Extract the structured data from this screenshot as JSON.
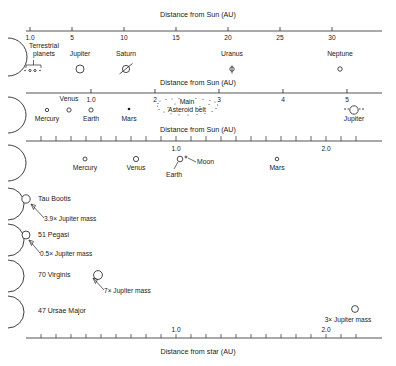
{
  "figure": {
    "bottom_axis_title": "Distance from star (AU)"
  },
  "panels": [
    {
      "id": "panel-outer-solar-system",
      "axis_title": "Distance from Sun (AU)",
      "axis_title_position": "top",
      "unit": "AU",
      "axis_range": [
        0,
        34
      ],
      "ticks": [
        {
          "value": 1.0,
          "label": "1.0"
        },
        {
          "value": 5,
          "label": "5"
        },
        {
          "value": 10,
          "label": "10"
        },
        {
          "value": 15,
          "label": "15"
        },
        {
          "value": 20,
          "label": "20"
        },
        {
          "value": 25,
          "label": "25"
        },
        {
          "value": 30,
          "label": "30"
        }
      ],
      "bodies": [
        {
          "name": "Terrestrial planets",
          "label": "Terrestrial\nplanets",
          "distance_au": 1.0,
          "marker": "bracket-with-dots",
          "count": 4
        },
        {
          "name": "Jupiter",
          "label": "Jupiter",
          "distance_au": 5.2,
          "marker": "open-circle",
          "radius": 4.0
        },
        {
          "name": "Saturn",
          "label": "Saturn",
          "distance_au": 9.5,
          "marker": "open-circle-with-ring",
          "radius": 3.6
        },
        {
          "name": "Uranus",
          "label": "Uranus",
          "distance_au": 19.2,
          "marker": "open-circle-with-axis",
          "radius": 2.2
        },
        {
          "name": "Neptune",
          "label": "Neptune",
          "distance_au": 30.1,
          "marker": "open-circle",
          "radius": 2.2
        }
      ]
    },
    {
      "id": "panel-inner-solar-system",
      "axis_title": "Distance from Sun (AU)",
      "axis_title_position": "top",
      "unit": "AU",
      "axis_range": [
        0,
        5.6
      ],
      "ticks": [
        {
          "value": 1.0,
          "label": "1.0"
        },
        {
          "value": 2,
          "label": "2"
        },
        {
          "value": 3,
          "label": "3"
        },
        {
          "value": 4,
          "label": "4"
        },
        {
          "value": 5,
          "label": "5"
        }
      ],
      "bodies": [
        {
          "name": "Mercury",
          "label": "Mercury",
          "distance_au": 0.39,
          "marker": "open-circle",
          "radius": 1.7
        },
        {
          "name": "Venus",
          "label": "Venus",
          "distance_au": 0.72,
          "marker": "open-circle",
          "radius": 2.1
        },
        {
          "name": "Earth",
          "label": "Earth",
          "distance_au": 1.0,
          "marker": "open-circle",
          "radius": 2.1
        },
        {
          "name": "Mars",
          "label": "Mars",
          "distance_au": 1.52,
          "marker": "filled-dot",
          "radius": 1.3
        },
        {
          "name": "Main Asteroid belt",
          "label": "Main\nAsteroid belt",
          "distance_range_au": [
            2.1,
            3.3
          ],
          "marker": "dotted-belt"
        },
        {
          "name": "Jupiter",
          "label": "Jupiter",
          "distance_au": 5.2,
          "marker": "open-circle-with-moons",
          "radius": 4.2
        }
      ]
    },
    {
      "id": "panel-earth-neighborhood",
      "axis_title": "Distance from Sun (AU)",
      "axis_title_position": "top",
      "unit": "AU",
      "axis_range": [
        0,
        2.35
      ],
      "tick_interval": 0.1,
      "ticks": [
        {
          "value": 1.0,
          "label": "1.0"
        },
        {
          "value": 2.0,
          "label": "2.0"
        }
      ],
      "bodies": [
        {
          "name": "Mercury",
          "label": "Mercury",
          "distance_au": 0.39,
          "marker": "open-circle",
          "radius": 2.0
        },
        {
          "name": "Venus",
          "label": "Venus",
          "distance_au": 0.72,
          "marker": "open-circle",
          "radius": 2.6
        },
        {
          "name": "Earth",
          "label": "Earth",
          "distance_au": 1.0,
          "marker": "open-circle",
          "radius": 2.8
        },
        {
          "name": "Moon",
          "label": "Moon",
          "distance_au": 1.03,
          "marker": "tiny-open-circle",
          "radius": 1.0
        },
        {
          "name": "Mars",
          "label": "Mars",
          "distance_au": 1.52,
          "marker": "open-circle",
          "radius": 1.8
        }
      ]
    }
  ],
  "exoplanet_systems": [
    {
      "id": "system-tau-bootis",
      "star_label": "Tau Bootis",
      "planet": {
        "distance_au": 0.046,
        "mass_label": "3.9× Jupiter mass",
        "mass_value": 3.9,
        "mass_unit": "Jupiter mass",
        "radius": 4.2
      }
    },
    {
      "id": "system-51-pegasi",
      "star_label": "51 Pegasi",
      "planet": {
        "distance_au": 0.05,
        "mass_label": "0.5× Jupiter mass",
        "mass_value": 0.5,
        "mass_unit": "Jupiter mass",
        "radius": 4.0
      }
    },
    {
      "id": "system-70-virginis",
      "star_label": "70 Virginis",
      "planet": {
        "distance_au": 0.47,
        "mass_label": "7× Jupiter mass",
        "mass_value": 7,
        "mass_unit": "Jupiter mass",
        "radius": 4.4
      }
    },
    {
      "id": "system-47-ursae-major",
      "star_label": "47 Ursae Major",
      "planet": {
        "distance_au": 2.1,
        "mass_label": "3× Jupiter mass",
        "mass_value": 3,
        "mass_unit": "Jupiter mass",
        "radius": 3.4
      }
    }
  ],
  "bottom_axis": {
    "title": "Distance from star (AU)",
    "unit": "AU",
    "axis_range": [
      0,
      2.35
    ],
    "tick_interval": 0.1,
    "ticks": [
      {
        "value": 1.0,
        "label": "1.0"
      },
      {
        "value": 2.0,
        "label": "2.0"
      }
    ]
  },
  "colors": {
    "ink": "#1a1a1a",
    "line": "#2a2a2a",
    "background": "#ffffff"
  }
}
